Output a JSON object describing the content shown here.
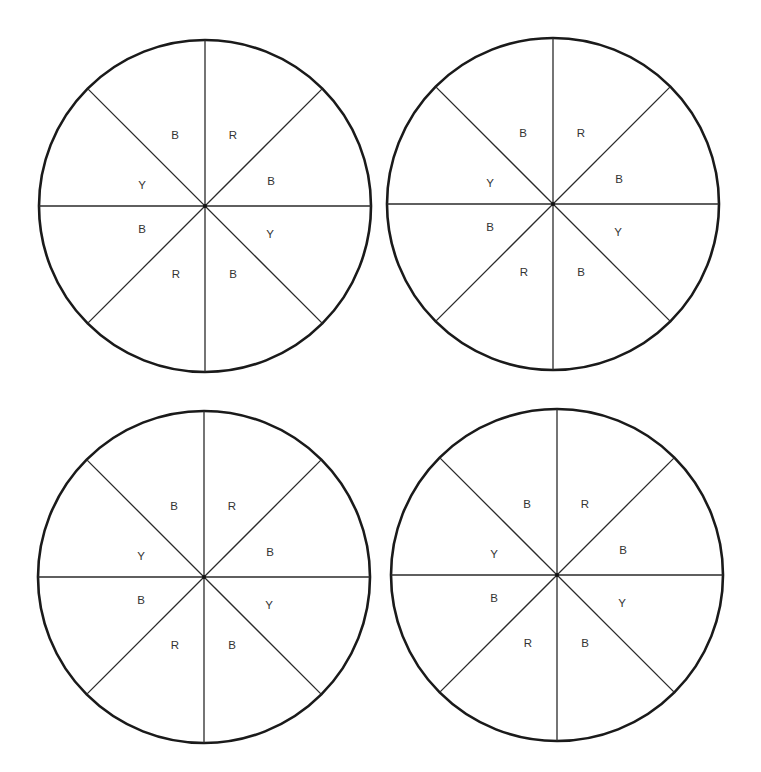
{
  "diagram": {
    "type": "spinner-set",
    "radius": 166,
    "sector_labels_clockwise_from_top_right": [
      "R",
      "B",
      "Y",
      "B",
      "R",
      "B",
      "Y",
      "B"
    ],
    "label_legend": {
      "R": "Red",
      "B": "Blue",
      "Y": "Yellow"
    },
    "spinners": [
      {
        "id": "spinner-1",
        "cx": 205,
        "cy": 206,
        "labels": [
          "R",
          "B",
          "Y",
          "B",
          "R",
          "B",
          "Y",
          "B"
        ]
      },
      {
        "id": "spinner-2",
        "cx": 553,
        "cy": 204,
        "labels": [
          "R",
          "B",
          "Y",
          "B",
          "R",
          "B",
          "Y",
          "B"
        ]
      },
      {
        "id": "spinner-3",
        "cx": 204,
        "cy": 577,
        "labels": [
          "R",
          "B",
          "Y",
          "B",
          "R",
          "B",
          "Y",
          "B"
        ]
      },
      {
        "id": "spinner-4",
        "cx": 557,
        "cy": 575,
        "labels": [
          "R",
          "B",
          "Y",
          "B",
          "R",
          "B",
          "Y",
          "B"
        ]
      }
    ],
    "label_offsets": [
      {
        "dx": 28,
        "dy": -71
      },
      {
        "dx": 66,
        "dy": -25
      },
      {
        "dx": 65,
        "dy": 28
      },
      {
        "dx": 28,
        "dy": 68
      },
      {
        "dx": -29,
        "dy": 68
      },
      {
        "dx": -63,
        "dy": 23
      },
      {
        "dx": -63,
        "dy": -21
      },
      {
        "dx": -30,
        "dy": -71
      }
    ]
  }
}
